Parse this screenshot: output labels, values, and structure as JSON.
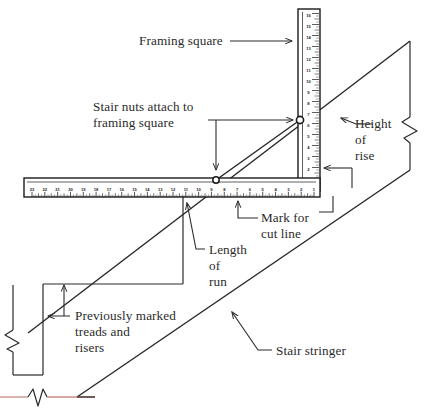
{
  "figure": {
    "title_visible": false,
    "background_color": "#ffffff",
    "line_color": "#2b2b2b",
    "baseline_color": "#c98a85",
    "ruler_fill": "#ffffff",
    "ruler_edge_color": "#1a1a1a"
  },
  "labels": {
    "framing_square": "Framing square",
    "stair_nuts_line1": "Stair nuts attach to",
    "stair_nuts_line2": "framing square",
    "height_of_rise_line1": "Height",
    "height_of_rise_line2": "of",
    "height_of_rise_line3": "rise",
    "mark_for_cut_line1": "Mark for",
    "mark_for_cut_line2": "cut line",
    "length_of_run_line1": "Length",
    "length_of_run_line2": "of",
    "length_of_run_line3": "run",
    "previously_marked_line1": "Previously marked",
    "previously_marked_line2": "treads and",
    "previously_marked_line3": "risers",
    "stair_stringer": "Stair stringer"
  },
  "horizontal_ruler": {
    "orientation": "horizontal",
    "numbering_direction": "right-to-left",
    "numbers": [
      23,
      22,
      21,
      20,
      19,
      18,
      17,
      16,
      15,
      14,
      13,
      12,
      11,
      10,
      9,
      8,
      7,
      6,
      5,
      4,
      3,
      2,
      1
    ],
    "unit": "inch"
  },
  "vertical_ruler": {
    "orientation": "vertical",
    "numbering_direction": "top-to-bottom",
    "numbers": [
      16,
      15,
      14,
      13,
      12,
      11,
      10,
      9,
      8,
      7,
      6,
      5,
      4,
      3,
      2,
      1
    ],
    "unit": "inch"
  },
  "markers": {
    "stair_nut_upper": "stair-nut-upper",
    "stair_nut_lower": "stair-nut-lower",
    "break_symbol_right": "break-symbol",
    "break_symbol_left": "break-symbol",
    "break_symbol_baseline": "break-symbol"
  },
  "icons": {
    "arrow_right": "arrow-right-icon",
    "arrow_left": "arrow-left-icon",
    "arrow_up": "arrow-up-icon",
    "arrow_down": "arrow-down-icon"
  }
}
